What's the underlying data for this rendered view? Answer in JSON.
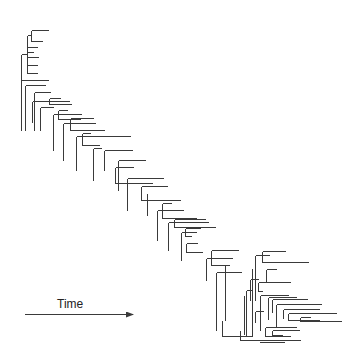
{
  "figure": {
    "type": "phylogenetic-tree",
    "axis_label": "Time",
    "arrow": {
      "x1": 25,
      "y1": 314,
      "x2": 133,
      "y2": 314
    },
    "line_color": "#3a3a3a"
  },
  "segments": [
    [
      31,
      30,
      31,
      41
    ],
    [
      31,
      30,
      48,
      30
    ],
    [
      31,
      41,
      42,
      41
    ],
    [
      27,
      35,
      27,
      73
    ],
    [
      27,
      35,
      31,
      35
    ],
    [
      27,
      47,
      37,
      47
    ],
    [
      27,
      52,
      33,
      52
    ],
    [
      27,
      57,
      38,
      57
    ],
    [
      27,
      65,
      37,
      65
    ],
    [
      27,
      73,
      37,
      73
    ],
    [
      21,
      54,
      21,
      130
    ],
    [
      21,
      54,
      27,
      54
    ],
    [
      21,
      80,
      48,
      80
    ],
    [
      25,
      85,
      25,
      130
    ],
    [
      25,
      85,
      45,
      85
    ],
    [
      34,
      92,
      34,
      130
    ],
    [
      34,
      92,
      50,
      92
    ],
    [
      32,
      101,
      32,
      122
    ],
    [
      32,
      101,
      69,
      101
    ],
    [
      40,
      107,
      40,
      130
    ],
    [
      40,
      107,
      53,
      107
    ],
    [
      49,
      98,
      49,
      104
    ],
    [
      49,
      98,
      60,
      98
    ],
    [
      49,
      104,
      71,
      104
    ],
    [
      53,
      114,
      53,
      150
    ],
    [
      53,
      114,
      81,
      114
    ],
    [
      58,
      110,
      58,
      119
    ],
    [
      58,
      110,
      67,
      110
    ],
    [
      58,
      119,
      80,
      119
    ],
    [
      63,
      123,
      63,
      160
    ],
    [
      63,
      123,
      95,
      123
    ],
    [
      70,
      118,
      70,
      130
    ],
    [
      70,
      118,
      93,
      118
    ],
    [
      70,
      130,
      104,
      130
    ],
    [
      76,
      136,
      76,
      170
    ],
    [
      76,
      136,
      130,
      136
    ],
    [
      82,
      133,
      82,
      145
    ],
    [
      82,
      133,
      90,
      133
    ],
    [
      82,
      145,
      99,
      145
    ],
    [
      93,
      148,
      93,
      180
    ],
    [
      93,
      148,
      101,
      148
    ],
    [
      104,
      150,
      104,
      170
    ],
    [
      104,
      150,
      132,
      150
    ],
    [
      118,
      160,
      118,
      190
    ],
    [
      118,
      160,
      145,
      160
    ],
    [
      115,
      167,
      115,
      183
    ],
    [
      115,
      167,
      133,
      167
    ],
    [
      115,
      183,
      152,
      183
    ],
    [
      127,
      178,
      127,
      210
    ],
    [
      127,
      178,
      163,
      178
    ],
    [
      141,
      186,
      141,
      200
    ],
    [
      141,
      186,
      167,
      186
    ],
    [
      141,
      200,
      180,
      200
    ],
    [
      147,
      193,
      147,
      215
    ],
    [
      157,
      210,
      157,
      240
    ],
    [
      157,
      210,
      183,
      210
    ],
    [
      162,
      203,
      162,
      218
    ],
    [
      162,
      203,
      171,
      203
    ],
    [
      162,
      218,
      196,
      218
    ],
    [
      168,
      222,
      168,
      250
    ],
    [
      168,
      222,
      208,
      222
    ],
    [
      174,
      219,
      174,
      227
    ],
    [
      174,
      219,
      205,
      219
    ],
    [
      174,
      227,
      215,
      227
    ],
    [
      181,
      232,
      181,
      260
    ],
    [
      181,
      232,
      196,
      232
    ],
    [
      185,
      228,
      185,
      236
    ],
    [
      185,
      228,
      200,
      228
    ],
    [
      185,
      236,
      191,
      236
    ],
    [
      186,
      243,
      186,
      252
    ],
    [
      186,
      243,
      197,
      243
    ],
    [
      186,
      252,
      202,
      252
    ],
    [
      206,
      258,
      206,
      280
    ],
    [
      206,
      258,
      232,
      258
    ],
    [
      211,
      250,
      211,
      265
    ],
    [
      211,
      250,
      238,
      250
    ],
    [
      211,
      265,
      229,
      265
    ],
    [
      216,
      272,
      216,
      330
    ],
    [
      216,
      272,
      241,
      272
    ],
    [
      225,
      265,
      225,
      320
    ],
    [
      244,
      295,
      244,
      334
    ],
    [
      255,
      255,
      255,
      300
    ],
    [
      255,
      255,
      269,
      255
    ],
    [
      262,
      251,
      262,
      262
    ],
    [
      262,
      251,
      285,
      251
    ],
    [
      262,
      262,
      308,
      262
    ],
    [
      266,
      269,
      266,
      282
    ],
    [
      266,
      269,
      276,
      269
    ],
    [
      266,
      282,
      282,
      282
    ],
    [
      252,
      268,
      252,
      335
    ]
  ],
  "extra_segments": [
    [
      246,
      290,
      246,
      336
    ],
    [
      246,
      290,
      252,
      290
    ],
    [
      250,
      279,
      250,
      300
    ],
    [
      250,
      279,
      258,
      279
    ],
    [
      258,
      282,
      258,
      291
    ],
    [
      258,
      282,
      290,
      282
    ],
    [
      258,
      291,
      262,
      291
    ],
    [
      260,
      295,
      260,
      330
    ],
    [
      260,
      295,
      288,
      295
    ],
    [
      268,
      297,
      268,
      319
    ],
    [
      268,
      297,
      296,
      297
    ],
    [
      272,
      299,
      272,
      312
    ],
    [
      272,
      299,
      307,
      299
    ],
    [
      276,
      304,
      276,
      318
    ],
    [
      276,
      304,
      321,
      304
    ],
    [
      283,
      309,
      283,
      318
    ],
    [
      283,
      309,
      319,
      309
    ],
    [
      288,
      313,
      288,
      320
    ],
    [
      288,
      313,
      336,
      313
    ],
    [
      288,
      320,
      319,
      320
    ],
    [
      300,
      317,
      300,
      321
    ],
    [
      300,
      317,
      310,
      317
    ],
    [
      300,
      321,
      341,
      321
    ],
    [
      265,
      327,
      265,
      336
    ],
    [
      265,
      327,
      296,
      327
    ],
    [
      265,
      336,
      290,
      336
    ],
    [
      272,
      330,
      272,
      335
    ],
    [
      272,
      330,
      299,
      330
    ],
    [
      272,
      335,
      282,
      335
    ],
    [
      276,
      316,
      276,
      327
    ],
    [
      276,
      327,
      284,
      327
    ],
    [
      255,
      311,
      255,
      322
    ],
    [
      255,
      311,
      263,
      311
    ],
    [
      222,
      320,
      222,
      336
    ],
    [
      222,
      336,
      252,
      336
    ],
    [
      240,
      330,
      240,
      340
    ],
    [
      240,
      340,
      300,
      340
    ],
    [
      259,
      342,
      284,
      342
    ]
  ]
}
